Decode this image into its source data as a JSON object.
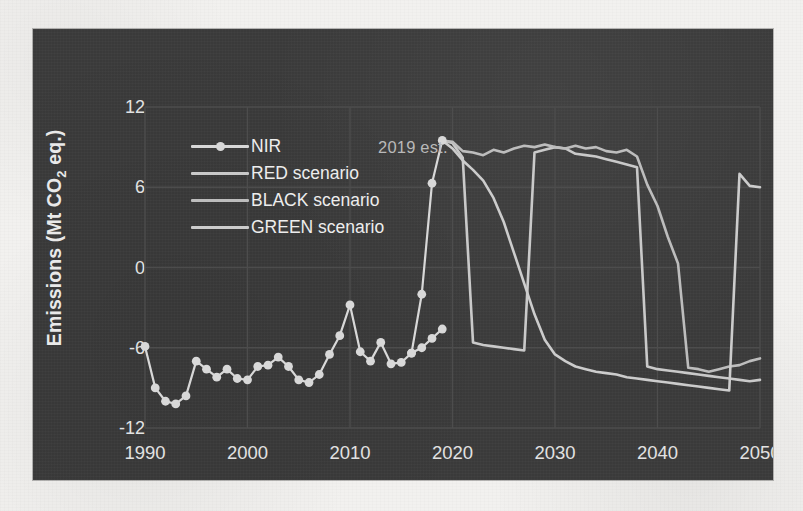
{
  "chart_data": {
    "type": "line",
    "title": "",
    "xlabel": "",
    "ylabel": "Emissions (Mt CO2 eq.)",
    "ylabel_prefix": "Emissions (Mt CO",
    "ylabel_sub": "2",
    "ylabel_suffix": " eq.)",
    "xlim": [
      1990,
      2050
    ],
    "ylim": [
      -12,
      12
    ],
    "yticks": [
      12,
      6,
      0,
      -6,
      -12
    ],
    "xticks": [
      1990,
      2000,
      2010,
      2020,
      2030,
      2040,
      2050
    ],
    "grid": true,
    "grid_x_every": 10,
    "grid_y_every": 6,
    "legend_position": "upper-left",
    "annotations": [
      {
        "text": "2019 est.",
        "x": 2017.5,
        "y": 11.0
      }
    ],
    "colors": {
      "background": "#3a3a3a",
      "nir": "#d8d8d8",
      "red": "#c9c9c9",
      "black": "#bdbdbd",
      "green": "#cccccc",
      "grid": "#4e4e4e",
      "text": "#e6e6e6",
      "annotation": "#b9b9b9"
    },
    "series": [
      {
        "name": "NIR",
        "style": "line-markers",
        "x": [
          1990,
          1991,
          1992,
          1993,
          1994,
          1995,
          1996,
          1997,
          1998,
          1999,
          2000,
          2001,
          2002,
          2003,
          2004,
          2005,
          2006,
          2007,
          2008,
          2009,
          2010,
          2011,
          2012,
          2013,
          2014,
          2015,
          2016,
          2017,
          2018,
          2019
        ],
        "values": [
          -5.9,
          -9.0,
          -10.0,
          -10.2,
          -9.6,
          -7.0,
          -7.6,
          -8.2,
          -7.6,
          -8.3,
          -8.4,
          -7.4,
          -7.3,
          -6.7,
          -7.4,
          -8.4,
          -8.6,
          -8.0,
          -6.5,
          -5.1,
          -2.8,
          -6.3,
          -7.0,
          -5.6,
          -7.2,
          -7.1,
          -6.4,
          -6.0,
          -5.3,
          -4.6
        ]
      },
      {
        "name": "NIR_recent",
        "style": "line-markers",
        "x": [
          2016,
          2017,
          2018,
          2019
        ],
        "values": [
          -6.4,
          -2.0,
          6.3,
          9.5
        ]
      },
      {
        "name": "RED scenario",
        "style": "line",
        "x": [
          2019,
          2020,
          2021,
          2022,
          2023,
          2024,
          2025,
          2026,
          2027,
          2028,
          2029,
          2030,
          2031,
          2032,
          2033,
          2034,
          2035,
          2036,
          2037,
          2038,
          2039,
          2040,
          2041,
          2042,
          2043,
          2044,
          2045,
          2046,
          2047,
          2048,
          2049,
          2050
        ],
        "values": [
          9.5,
          9.3,
          8.2,
          -5.6,
          -5.8,
          -5.9,
          -6.0,
          -6.1,
          -6.2,
          8.6,
          8.8,
          9.0,
          8.9,
          8.5,
          8.4,
          8.3,
          8.1,
          7.9,
          7.7,
          7.5,
          -7.4,
          -7.6,
          -7.7,
          -7.8,
          -7.9,
          -8.0,
          -8.1,
          -8.2,
          -8.3,
          -8.4,
          -8.5,
          -8.4
        ]
      },
      {
        "name": "BLACK scenario",
        "style": "line",
        "x": [
          2019,
          2020,
          2021,
          2022,
          2023,
          2024,
          2025,
          2026,
          2027,
          2028,
          2029,
          2030,
          2031,
          2032,
          2033,
          2034,
          2035,
          2036,
          2037,
          2038,
          2039,
          2040,
          2041,
          2042,
          2043,
          2044,
          2045,
          2046,
          2047,
          2048,
          2049,
          2050
        ],
        "values": [
          9.5,
          9.4,
          8.7,
          8.6,
          8.4,
          8.8,
          8.6,
          8.9,
          9.1,
          9.0,
          9.2,
          9.0,
          8.9,
          9.1,
          8.9,
          9.0,
          8.7,
          8.6,
          8.8,
          8.3,
          6.2,
          4.6,
          2.3,
          0.3,
          -7.5,
          -7.6,
          -7.8,
          -7.6,
          -7.4,
          -7.3,
          -7.0,
          -6.8
        ]
      },
      {
        "name": "GREEN scenario",
        "style": "line",
        "x": [
          2019,
          2020,
          2021,
          2022,
          2023,
          2024,
          2025,
          2026,
          2027,
          2028,
          2029,
          2030,
          2031,
          2032,
          2033,
          2034,
          2035,
          2036,
          2037,
          2038,
          2039,
          2040,
          2041,
          2042,
          2043,
          2044,
          2045,
          2046,
          2047,
          2048,
          2049,
          2050
        ],
        "values": [
          9.5,
          8.9,
          8.0,
          7.3,
          6.5,
          5.2,
          3.4,
          1.1,
          -1.2,
          -3.5,
          -5.4,
          -6.5,
          -7.0,
          -7.4,
          -7.6,
          -7.8,
          -7.9,
          -8.0,
          -8.2,
          -8.3,
          -8.4,
          -8.5,
          -8.6,
          -8.7,
          -8.8,
          -8.9,
          -9.0,
          -9.1,
          -9.2,
          7.0,
          6.1,
          6.0
        ]
      }
    ]
  },
  "legend": {
    "items": [
      {
        "label": "NIR",
        "color": "#d8d8d8",
        "marker": true
      },
      {
        "label": "RED scenario",
        "color": "#c9c9c9",
        "marker": false
      },
      {
        "label": "BLACK scenario",
        "color": "#bdbdbd",
        "marker": false
      },
      {
        "label": "GREEN scenario",
        "color": "#cccccc",
        "marker": false
      }
    ]
  },
  "axis": {
    "y_ticks": [
      "12",
      "6",
      "0",
      "-6",
      "-12"
    ],
    "x_ticks": [
      "1990",
      "2000",
      "2010",
      "2020",
      "2030",
      "2040",
      "2050"
    ]
  },
  "annotation": {
    "label": "2019 est."
  }
}
